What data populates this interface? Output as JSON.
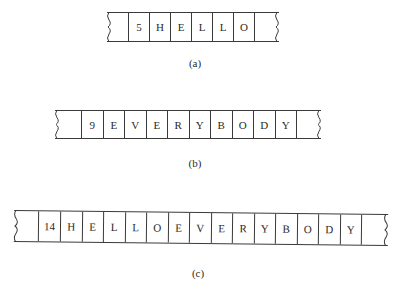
{
  "figure": {
    "rows": [
      {
        "id": "a",
        "caption": "(a)",
        "cells": [
          "5",
          "H",
          "E",
          "L",
          "L",
          "O"
        ]
      },
      {
        "id": "b",
        "caption": "(b)",
        "cells": [
          "9",
          "E",
          "V",
          "E",
          "R",
          "Y",
          "B",
          "O",
          "D",
          "Y"
        ]
      },
      {
        "id": "c",
        "caption": "(c)",
        "cells": [
          "14",
          "H",
          "E",
          "L",
          "L",
          "O",
          "E",
          "V",
          "E",
          "R",
          "Y",
          "B",
          "O",
          "D",
          "Y"
        ]
      }
    ]
  }
}
